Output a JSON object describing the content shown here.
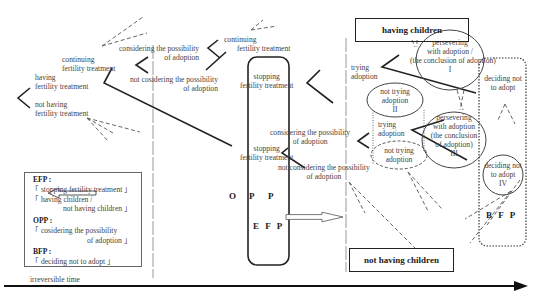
{
  "diagram": {
    "left_branch": {
      "having": "having",
      "having2": "fertility treatment",
      "not_having": "not having",
      "not_having2": "fertility treatment",
      "continuing": "continuing",
      "continuing2": "fertility treatment"
    },
    "col2": {
      "considering1": "considering the possibility",
      "considering2": "of adoption",
      "not_considering1": "not cosidering the possibility",
      "not_considering2": "of adoption"
    },
    "col3": {
      "continuing": "continuing",
      "continuing2": "fertility treatment",
      "stopping": "stopping",
      "stopping2": "fertility treatment",
      "stopping_b": "stopping",
      "stopping_b2": "fertility treatment",
      "considering1": "considering the possibility",
      "considering2": "of adoption",
      "not_considering1": "not considering the possibility",
      "not_considering2": "of adoption"
    },
    "col4": {
      "trying": "trying",
      "trying2": "adoption",
      "not_trying_ii": [
        "not trying",
        "adoption",
        "II"
      ],
      "trying_b": "trying",
      "trying_b2": "adoption",
      "not_trying_b": [
        "not trying",
        "adoption"
      ]
    },
    "ellipses": {
      "I": [
        "persevering",
        "with adoption /",
        "(the conclusion of adoption)",
        "I"
      ],
      "III": [
        "persevering",
        "with adoption",
        "(the conclusion",
        "of adoption)",
        "III"
      ],
      "IV": [
        "deciding not",
        "to adopt",
        "IV"
      ]
    },
    "deciding_not": [
      "deciding not",
      "to adopt"
    ],
    "outcome_top": "having children",
    "outcome_bottom": "not having children",
    "markers": {
      "opp": [
        "O",
        "P",
        "P"
      ],
      "efp": "E F P",
      "bfp": "B F P"
    },
    "legend": {
      "efp_title": "EFP :",
      "efp_line1": "「 stopping fertility treatment 」",
      "efp_line2": "「 having children /",
      "efp_line3": "not having children 」",
      "opp_title": "OPP :",
      "opp_line1": "「 cosidering the possibility",
      "opp_line2": "of adoption 」",
      "bfp_title": "BFP :",
      "bfp_line1": "「 deciding not to adopt 」"
    },
    "time_axis_label": "irreversible time"
  }
}
